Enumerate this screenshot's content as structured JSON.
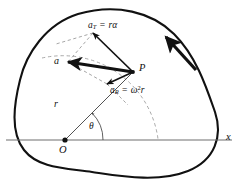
{
  "figure": {
    "kind": "physics-diagram",
    "colors": {
      "body_outline": "#111111",
      "vector": "#111111",
      "construction_dashed": "#8a8a8a",
      "axis": "#6e6e6e",
      "background": "#ffffff"
    }
  },
  "labels": {
    "tangential_symbol": "a",
    "tangential_sub": "T",
    "tangential_equals": " = ",
    "tangential_value": "r",
    "tangential_value_sym": "α",
    "radial_symbol": "a",
    "radial_sub": "R",
    "radial_equals": " = ",
    "radial_omega": "ω",
    "radial_power": "2",
    "radial_r": "r",
    "resultant": "a",
    "point": "P",
    "radius": "r",
    "angle": "θ",
    "origin": "O",
    "axis_x": "x"
  },
  "geometry": {
    "origin": {
      "x": 65,
      "y": 140
    },
    "point_P": {
      "x": 133,
      "y": 72
    },
    "tangential_tip": {
      "x": 93,
      "y": 33
    },
    "radial_tip": {
      "x": 107,
      "y": 84
    },
    "resultant_tip": {
      "x": 68,
      "y": 62
    },
    "axis_y": 140,
    "axis_x_start": 6,
    "axis_x_end": 232,
    "radius_length_px": 96,
    "theta_degrees": 45
  },
  "annotations": {
    "rotation_arrow": "counterclockwise rotation direction indicator",
    "dashed_arc": "circular path traced by point P about O",
    "dashed_parallelogram": "vector addition construction for resultant a"
  }
}
